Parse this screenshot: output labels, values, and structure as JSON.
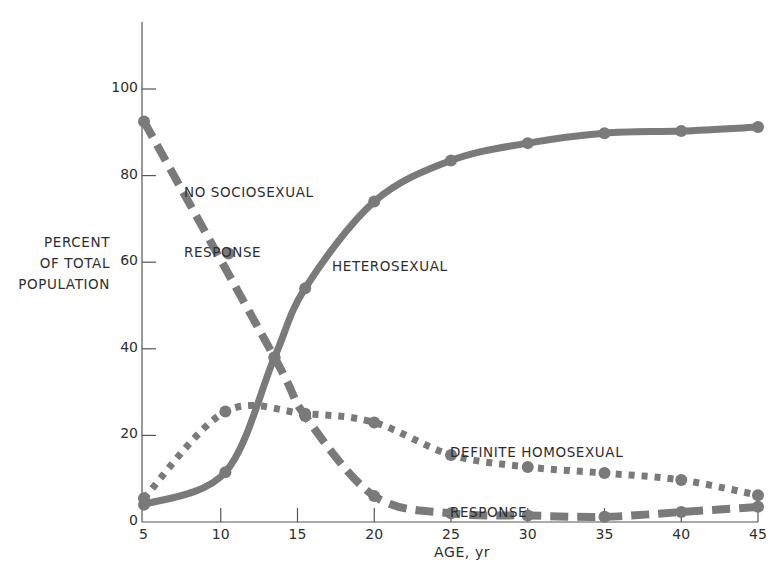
{
  "chart_data": {
    "type": "line",
    "title": "",
    "xlabel": "AGE, yr",
    "ylabel": "PERCENT OF TOTAL POPULATION",
    "ylabel_lines": [
      "PERCENT",
      "OF TOTAL",
      "POPULATION"
    ],
    "xlim": [
      5,
      45
    ],
    "ylim": [
      0,
      115
    ],
    "x_ticks": [
      5,
      10,
      15,
      20,
      25,
      30,
      35,
      40,
      45
    ],
    "y_ticks": [
      0,
      20,
      40,
      60,
      80,
      100
    ],
    "grid": false,
    "legend": "inline labels",
    "series": [
      {
        "name": "HETEROSEXUAL",
        "style": "solid",
        "points": [
          [
            5,
            4
          ],
          [
            10.3,
            11.5
          ],
          [
            13.5,
            38
          ],
          [
            15.5,
            54
          ],
          [
            20,
            74
          ],
          [
            25,
            83.5
          ],
          [
            30,
            87.5
          ],
          [
            35,
            89.8
          ],
          [
            40,
            90.3
          ],
          [
            45,
            91.2
          ]
        ]
      },
      {
        "name": "NO SOCIOSEXUAL RESPONSE",
        "style": "dashed",
        "points": [
          [
            5,
            92.5
          ],
          [
            10.5,
            62
          ],
          [
            13.5,
            38
          ],
          [
            15.5,
            24.5
          ],
          [
            20,
            6
          ],
          [
            25,
            2
          ],
          [
            30,
            1.5
          ],
          [
            35,
            1.2
          ],
          [
            40,
            2.3
          ],
          [
            45,
            3.5
          ]
        ]
      },
      {
        "name": "DEFINITE HOMOSEXUAL RESPONSE",
        "style": "dotted",
        "points": [
          [
            5,
            5.5
          ],
          [
            10.3,
            25.5
          ],
          [
            15.5,
            25
          ],
          [
            20,
            23
          ],
          [
            25,
            15.5
          ],
          [
            30,
            12.7
          ],
          [
            35,
            11.3
          ],
          [
            40,
            9.7
          ],
          [
            45,
            6.2
          ]
        ]
      }
    ],
    "annotations": [
      {
        "text": "NO SOCIOSEXUAL\nRESPONSE",
        "series": "NO SOCIOSEXUAL RESPONSE"
      },
      {
        "text": "HETEROSEXUAL",
        "series": "HETEROSEXUAL"
      },
      {
        "text": "DEFINITE HOMOSEXUAL\nRESPONSE",
        "series": "DEFINITE HOMOSEXUAL RESPONSE"
      }
    ]
  },
  "labels": {
    "no_response_line1": "NO SOCIOSEXUAL",
    "no_response_line2": "RESPONSE",
    "heterosexual": "HETEROSEXUAL",
    "homosexual_line1": "DEFINITE HOMOSEXUAL",
    "homosexual_line2": "RESPONSE",
    "xlabel": "AGE, yr",
    "ylabel_1": "PERCENT",
    "ylabel_2": "OF TOTAL",
    "ylabel_3": "POPULATION"
  },
  "colors": {
    "curve": "#7a7a7a",
    "axis": "#555555",
    "text": "#2e2e2e"
  }
}
